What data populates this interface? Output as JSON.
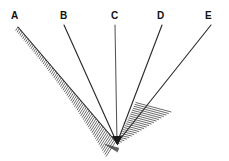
{
  "figure": {
    "background_color": "#ffffff",
    "width": 229,
    "height": 161,
    "line_color": "#2b2b2b",
    "hatch_color": "#3a3a3a",
    "label_color": "#111111",
    "vertex": {
      "x": 117,
      "y": 143
    }
  },
  "labels": {
    "a": "A",
    "b": "B",
    "c": "C",
    "d": "D",
    "e": "E"
  },
  "rays": [
    {
      "id": "a",
      "label": "A",
      "hatched": true,
      "label_x": 11,
      "label_y": 11,
      "start_x": 18,
      "start_y": 27,
      "end_x": 117,
      "end_y": 143
    },
    {
      "id": "b",
      "label": "B",
      "hatched": false,
      "label_x": 60,
      "label_y": 11,
      "start_x": 64,
      "start_y": 25,
      "end_x": 117,
      "end_y": 143
    },
    {
      "id": "c",
      "label": "C",
      "hatched": false,
      "label_x": 111,
      "label_y": 11,
      "start_x": 115,
      "start_y": 25,
      "end_x": 117,
      "end_y": 143
    },
    {
      "id": "d",
      "label": "D",
      "hatched": false,
      "label_x": 157,
      "label_y": 11,
      "start_x": 162,
      "start_y": 25,
      "end_x": 117,
      "end_y": 143
    },
    {
      "id": "e",
      "label": "E",
      "hatched": false,
      "label_x": 205,
      "label_y": 11,
      "start_x": 211,
      "start_y": 25,
      "end_x": 117,
      "end_y": 143
    }
  ]
}
